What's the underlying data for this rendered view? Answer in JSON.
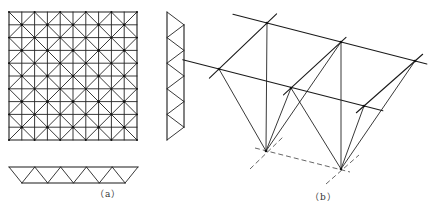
{
  "figure": {
    "panel_a": {
      "label": "（a）",
      "plan": {
        "x0": 9,
        "y0": 12,
        "size": 128,
        "bays": 5
      },
      "side_elevation": {
        "outer_x": 167,
        "inner_x": 184,
        "top": 12,
        "bays": 5,
        "bay": 25.6
      },
      "bottom_elevation": {
        "outer_y": 167,
        "inner_y": 183,
        "left": 9,
        "bays": 5,
        "bay": 25.8
      }
    },
    "panel_b": {
      "label": "（b）",
      "nodes": {
        "A": [
          267,
          23
        ],
        "B": [
          219,
          69
        ],
        "C": [
          341,
          42
        ],
        "D": [
          291,
          88
        ],
        "E": [
          415,
          61
        ],
        "F": [
          364,
          106
        ],
        "G": [
          266,
          151
        ],
        "H": [
          341,
          169
        ]
      }
    }
  },
  "colors": {
    "line": "#222222",
    "dash": "#555555",
    "background": "#ffffff"
  }
}
